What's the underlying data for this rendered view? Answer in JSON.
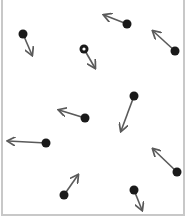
{
  "diagram": {
    "type": "particle-velocity-field",
    "width": 187,
    "height": 219,
    "frame": {
      "x": 2,
      "y": -2,
      "width": 182,
      "height": 217,
      "stroke": "#c8c8c8"
    },
    "colors": {
      "particle": "#1a1a1a",
      "arrow": "#5a5a5a",
      "background": "#ffffff"
    },
    "particles": [
      {
        "id": 1,
        "x": 23,
        "y": 34,
        "tip_x": 32,
        "tip_y": 55,
        "hollow": false
      },
      {
        "id": 2,
        "x": 84,
        "y": 49,
        "tip_x": 95,
        "tip_y": 68,
        "hollow": true
      },
      {
        "id": 3,
        "x": 127,
        "y": 24,
        "tip_x": 104,
        "tip_y": 15,
        "hollow": false
      },
      {
        "id": 4,
        "x": 175,
        "y": 51,
        "tip_x": 153,
        "tip_y": 31,
        "hollow": false
      },
      {
        "id": 5,
        "x": 134,
        "y": 96,
        "tip_x": 121,
        "tip_y": 131,
        "hollow": false
      },
      {
        "id": 6,
        "x": 85,
        "y": 118,
        "tip_x": 59,
        "tip_y": 110,
        "hollow": false
      },
      {
        "id": 7,
        "x": 46,
        "y": 143,
        "tip_x": 8,
        "tip_y": 141,
        "hollow": false
      },
      {
        "id": 8,
        "x": 177,
        "y": 172,
        "tip_x": 153,
        "tip_y": 149,
        "hollow": false
      },
      {
        "id": 9,
        "x": 64,
        "y": 195,
        "tip_x": 78,
        "tip_y": 175,
        "hollow": false
      },
      {
        "id": 10,
        "x": 134,
        "y": 190,
        "tip_x": 142,
        "tip_y": 210,
        "hollow": false
      }
    ]
  }
}
